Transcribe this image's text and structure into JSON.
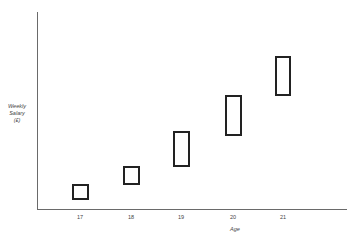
{
  "chart_data": {
    "type": "box-range",
    "title": "",
    "xlabel": "Age",
    "ylabel": "Weekly Salary (£)",
    "ylabel_lines": [
      "Weekly",
      "Salary",
      "(£)"
    ],
    "categories": [
      "17",
      "18",
      "19",
      "20",
      "21"
    ],
    "y_tick_labels": [],
    "grid": false,
    "legend": null,
    "note": "Y axis is unlabeled (no numeric ticks); values are relative heights in pixel units above the x-axis, showing salary ranges widening and rising with age.",
    "ranges": [
      {
        "category": "17",
        "low": 9,
        "high": 25
      },
      {
        "category": "18",
        "low": 24,
        "high": 43
      },
      {
        "category": "19",
        "low": 42,
        "high": 78
      },
      {
        "category": "20",
        "low": 73,
        "high": 114
      },
      {
        "category": "21",
        "low": 113,
        "high": 153
      }
    ],
    "ylim": [
      0,
      198
    ]
  },
  "axis": {
    "x_label": "Age",
    "y_label_lines": [
      "Weekly",
      "Salary",
      "(£)"
    ],
    "ticks": [
      "17",
      "18",
      "19",
      "20",
      "21"
    ]
  }
}
